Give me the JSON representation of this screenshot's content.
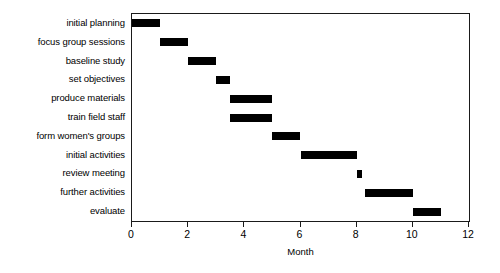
{
  "chart_data": {
    "type": "bar",
    "subtype": "gantt",
    "title": "",
    "xlabel": "Month",
    "ylabel": "",
    "xlim": [
      0,
      12
    ],
    "xticks": [
      0,
      2,
      4,
      6,
      8,
      10,
      12
    ],
    "xticklabels": [
      "0",
      "2",
      "4",
      "6",
      "8",
      "10",
      "12"
    ],
    "grid": false,
    "legend": null,
    "bar_color": "#000000",
    "background_color": "#ffffff",
    "axes_color": "#1a1a1a",
    "categories": [
      "initial planning",
      "focus group sessions",
      "baseline study",
      "set objectives",
      "produce materials",
      "train field staff",
      "form women's groups",
      "initial activities",
      "review meeting",
      "further activities",
      "evaluate"
    ],
    "tasks": [
      {
        "label": "initial planning",
        "start": 0,
        "end": 1,
        "duration": 1
      },
      {
        "label": "focus group sessions",
        "start": 1,
        "end": 2,
        "duration": 1
      },
      {
        "label": "baseline study",
        "start": 2,
        "end": 3,
        "duration": 1
      },
      {
        "label": "set objectives",
        "start": 3,
        "end": 3.5,
        "duration": 0.5
      },
      {
        "label": "produce materials",
        "start": 3.5,
        "end": 5,
        "duration": 1.5
      },
      {
        "label": "train field staff",
        "start": 3.5,
        "end": 5,
        "duration": 1.5
      },
      {
        "label": "form women's groups",
        "start": 5,
        "end": 6,
        "duration": 1
      },
      {
        "label": "initial activities",
        "start": 6,
        "end": 8,
        "duration": 2
      },
      {
        "label": "review meeting",
        "start": 8,
        "end": 8.2,
        "duration": 0.2
      },
      {
        "label": "further activities",
        "start": 8.3,
        "end": 10,
        "duration": 1.7
      },
      {
        "label": "evaluate",
        "start": 10,
        "end": 11,
        "duration": 1
      }
    ]
  }
}
